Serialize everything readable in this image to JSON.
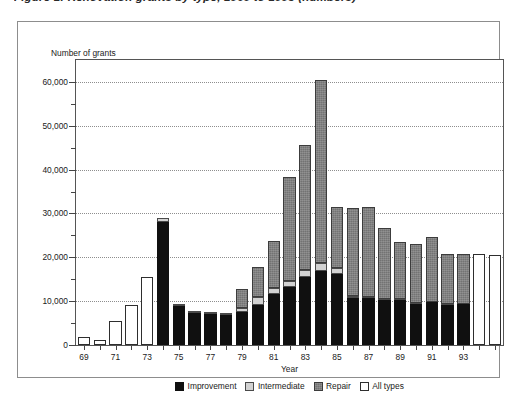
{
  "figure": {
    "caption": "Figure 1: Renovation grants by type, 1969 to 1995 (numbers)",
    "y_axis_caption": "Number of grants",
    "x_axis_caption": "Year"
  },
  "legend": {
    "position": "bottom-center",
    "items": [
      {
        "label": "Improvement",
        "key": "improvement",
        "color": "#101010"
      },
      {
        "label": "Intermediate",
        "key": "intermediate",
        "color": "#d2d2d2"
      },
      {
        "label": "Repair",
        "key": "repair",
        "color": "#737373"
      },
      {
        "label": "All types",
        "key": "all_types",
        "color": "#ffffff"
      }
    ]
  },
  "chart_data": {
    "type": "bar",
    "stacked": true,
    "title": "Renovation grants by type, 1969 to 1995 (numbers)",
    "xlabel": "Year",
    "ylabel": "Number of grants",
    "ylim": [
      0,
      65000
    ],
    "ytick_values": [
      0,
      10000,
      20000,
      30000,
      40000,
      50000,
      60000
    ],
    "ytick_labels": [
      "0",
      "10,000",
      "20,000",
      "30,000",
      "40,000",
      "50,000",
      "60,000"
    ],
    "yminor_step": 5000,
    "grid": "horizontal-dotted",
    "categories": [
      "69",
      "70",
      "71",
      "72",
      "73",
      "74",
      "75",
      "76",
      "77",
      "78",
      "79",
      "80",
      "81",
      "82",
      "83",
      "84",
      "85",
      "86",
      "87",
      "88",
      "89",
      "90",
      "91",
      "92",
      "93",
      "94",
      "95"
    ],
    "xtick_labels_shown": [
      "69",
      "71",
      "73",
      "75",
      "77",
      "79",
      "81",
      "83",
      "85",
      "87",
      "89",
      "91",
      "93"
    ],
    "series": [
      {
        "name": "Improvement",
        "values": [
          0,
          0,
          0,
          0,
          0,
          28000,
          8800,
          7300,
          7000,
          6800,
          7500,
          9200,
          11700,
          13200,
          15400,
          16900,
          16300,
          10800,
          10700,
          10200,
          10200,
          9300,
          9700,
          9200,
          9300,
          0,
          0
        ]
      },
      {
        "name": "Intermediate",
        "values": [
          0,
          0,
          0,
          0,
          0,
          900,
          400,
          300,
          300,
          300,
          900,
          1700,
          1400,
          1500,
          1600,
          1900,
          1200,
          400,
          300,
          200,
          200,
          200,
          200,
          150,
          150,
          0,
          0
        ]
      },
      {
        "name": "Repair",
        "values": [
          0,
          0,
          0,
          0,
          0,
          0,
          0,
          0,
          0,
          0,
          4400,
          6900,
          10700,
          23600,
          28600,
          41700,
          14000,
          20100,
          20400,
          16400,
          13000,
          13500,
          14800,
          11400,
          11300,
          0,
          0
        ]
      },
      {
        "name": "All types",
        "values": [
          1800,
          1200,
          5400,
          9200,
          15400,
          0,
          0,
          0,
          0,
          0,
          0,
          0,
          0,
          0,
          0,
          0,
          0,
          0,
          0,
          0,
          0,
          0,
          0,
          0,
          0,
          20800,
          20600
        ]
      }
    ],
    "bar_totals": [
      1800,
      1200,
      5400,
      9200,
      15400,
      28900,
      9200,
      7600,
      7300,
      7100,
      12800,
      17800,
      23800,
      38300,
      45600,
      60500,
      31500,
      31300,
      31400,
      26800,
      23400,
      23000,
      24700,
      20750,
      20750,
      20800,
      20600
    ],
    "peak": {
      "category": "84",
      "value": 60500
    }
  }
}
